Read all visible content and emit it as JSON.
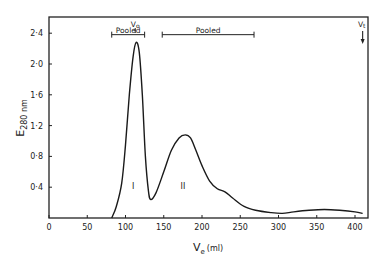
{
  "chart_data": {
    "type": "line",
    "title": "",
    "xlabel": "V",
    "xlabel_sub": "e",
    "xlabel_unit": "(ml)",
    "ylabel": "E",
    "ylabel_sub": "280 nm",
    "xlim": [
      0,
      420
    ],
    "ylim": [
      0,
      2.6
    ],
    "x_ticks": [
      0,
      50,
      100,
      150,
      200,
      250,
      300,
      350,
      400
    ],
    "x_tick_labels": [
      "0",
      "50",
      "100",
      "150",
      "200",
      "250",
      "300",
      "350",
      "400"
    ],
    "y_ticks": [
      0.4,
      0.8,
      1.2,
      1.6,
      2.0,
      2.4
    ],
    "y_tick_labels": [
      "0·4",
      "0·8",
      "1·2",
      "1·6",
      "2·0",
      "2·4"
    ],
    "grid": false,
    "legend": null,
    "series": [
      {
        "name": "Absorbance at 280 nm",
        "x": [
          82,
          88,
          95,
          100,
          105,
          110,
          114,
          118,
          122,
          126,
          130,
          133,
          140,
          150,
          160,
          170,
          178,
          185,
          192,
          200,
          210,
          220,
          230,
          240,
          255,
          270,
          290,
          305,
          320,
          340,
          360,
          380,
          400,
          410
        ],
        "y": [
          0.0,
          0.15,
          0.45,
          0.95,
          1.6,
          2.1,
          2.28,
          2.15,
          1.6,
          0.8,
          0.35,
          0.24,
          0.33,
          0.6,
          0.88,
          1.04,
          1.08,
          1.04,
          0.88,
          0.68,
          0.48,
          0.38,
          0.34,
          0.26,
          0.15,
          0.1,
          0.07,
          0.06,
          0.08,
          0.1,
          0.11,
          0.1,
          0.08,
          0.06
        ]
      }
    ],
    "annotations": [
      {
        "text": "V",
        "sub": "o",
        "x": 114,
        "note": "void volume arrow at top"
      },
      {
        "text": "V",
        "sub": "t",
        "x": 410,
        "note": "total volume arrow at top"
      },
      {
        "text": "Pooled",
        "x_range": [
          82,
          125
        ],
        "y": 2.42
      },
      {
        "text": "Pooled",
        "x_range": [
          148,
          268
        ],
        "y": 2.42
      },
      {
        "text": "I",
        "x": 110,
        "y": 0.38
      },
      {
        "text": "II",
        "x": 175,
        "y": 0.38
      }
    ]
  }
}
